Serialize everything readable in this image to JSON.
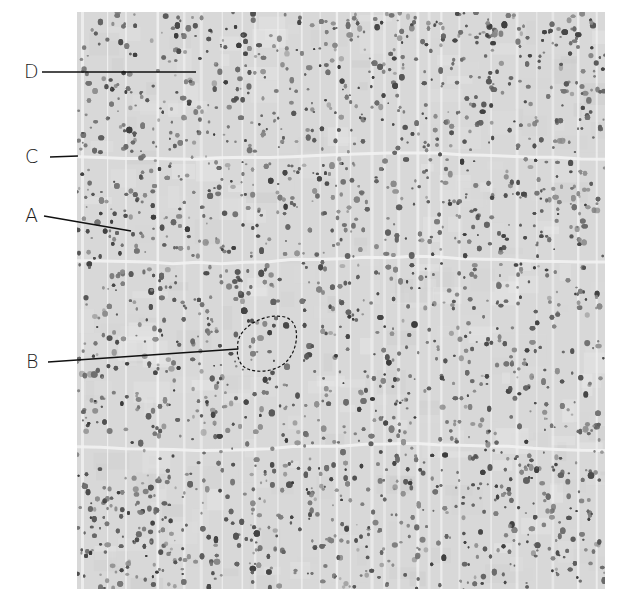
{
  "figure": {
    "background_color": "#ffffff",
    "texture_color": "#d8d8d8",
    "pore_color": "#5a5a5a",
    "ring_boundary_color": "#f2f2f2",
    "labels": [
      {
        "id": "D",
        "text": "D"
      },
      {
        "id": "C",
        "text": "C"
      },
      {
        "id": "A",
        "text": "A"
      },
      {
        "id": "B",
        "text": "B"
      }
    ]
  }
}
